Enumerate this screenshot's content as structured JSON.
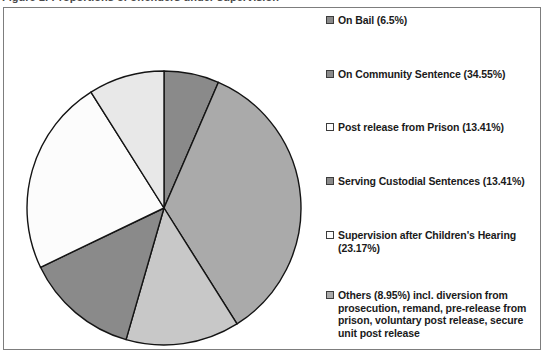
{
  "figure": {
    "cut_caption": "Figure 1: Proportions of offenders under supervision"
  },
  "chart_data": {
    "type": "pie",
    "title": "",
    "legend_position": "right",
    "start_angle_deg": 0,
    "direction": "clockwise",
    "center": {
      "x": 160,
      "y": 200
    },
    "radius": 137,
    "categories": [
      "On Bail",
      "On Community Sentence",
      "Post release from Prison",
      "Serving Custodial Sentences",
      "Supervision after Children's Hearing",
      "Others"
    ],
    "values": [
      6.5,
      34.55,
      13.41,
      13.41,
      23.17,
      8.95
    ],
    "value_unit": "%",
    "colors": [
      "#8a8a8a",
      "#aaaaaa",
      "#c8c8c8",
      "#8a8a8a",
      "#fcfcfc",
      "#e8e8e8"
    ],
    "legend": [
      {
        "label": "On Bail (6.5%)",
        "value": 6.5,
        "color": "#8a8a8a"
      },
      {
        "label": "On Community Sentence (34.55%)",
        "value": 34.55,
        "color": "#8a8a8a"
      },
      {
        "label": "Post release from Prison (13.41%)",
        "value": 13.41,
        "color": "#fcfcfc"
      },
      {
        "label": "Serving Custodial Sentences (13.41%)",
        "value": 13.41,
        "color": "#8a8a8a"
      },
      {
        "label": "Supervision after Children's Hearing (23.17%)",
        "value": 23.17,
        "color": "#fcfcfc"
      },
      {
        "label": "Others (8.95%) incl. diversion from prosecution, remand, pre-release from prison, voluntary post release, secure unit post release",
        "value": 8.95,
        "color": "#aaaaaa"
      }
    ]
  }
}
